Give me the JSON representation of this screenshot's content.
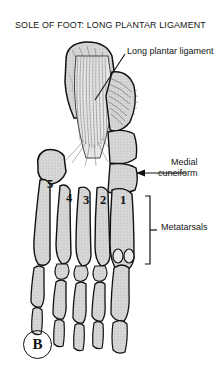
{
  "figure": {
    "title": "SOLE OF FOOT: LONG PLANTAR LIGAMENT",
    "panel_label": "B",
    "background_color": "#ffffff",
    "bone_fill_color": "#d8d8d8",
    "outline_color": "#111111",
    "ligament_fill_color": "#e4e4e4"
  },
  "labels": {
    "long_plantar_ligament": "Long plantar ligament",
    "medial_cuneiform_line1": "Medial",
    "medial_cuneiform_line2": "cuneiform",
    "metatarsals": "Metatarsals"
  },
  "metatarsal_numbers": [
    {
      "id": "metatarsal-5",
      "text": "5",
      "x": 47,
      "y": 178
    },
    {
      "id": "metatarsal-4",
      "text": "4",
      "x": 66,
      "y": 192
    },
    {
      "id": "metatarsal-3",
      "text": "3",
      "x": 83,
      "y": 194
    },
    {
      "id": "metatarsal-2",
      "text": "2",
      "x": 100,
      "y": 194
    },
    {
      "id": "metatarsal-1",
      "text": "1",
      "x": 120,
      "y": 194
    }
  ]
}
